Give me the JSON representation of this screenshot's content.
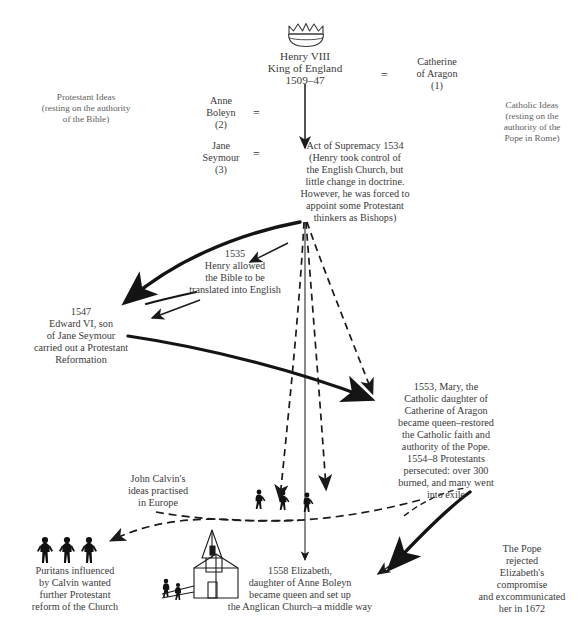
{
  "diagram": {
    "monarch": {
      "icon": "crown-icon",
      "name": "Henry VIII",
      "style": "King of England",
      "reign": "1509–47"
    },
    "wives": [
      {
        "name": "Catherine\nof Aragon",
        "order": "(1)",
        "marriage_symbol": "="
      },
      {
        "name": "Anne\nBoleyn",
        "order": "(2)",
        "marriage_symbol": "="
      },
      {
        "name": "Jane\nSeymour",
        "order": "(3)",
        "marriage_symbol": "="
      }
    ],
    "side_labels": {
      "left": "Protestant Ideas\n(resting on the authority\nof the Bible)",
      "right": "Catholic Ideas\n(resting on the\nauthority of the\nPope in Rome)"
    },
    "events": {
      "act_of_supremacy": "Act of Supremacy 1534\n(Henry took control of\nthe English Church, but\nlittle change in doctrine.\nHowever, he was forced to\nappoint some Protestant\nthinkers as Bishops)",
      "bible_english": "1535\nHenry allowed\nthe Bible to be\ntranslated into English",
      "edward_vi": "1547\nEdward VI, son\nof Jane Seymour\ncarried out a Protestant\nReformation",
      "mary_i": "1553, Mary, the\nCatholic daughter of\nCatherine of Aragon\nbecame queen–restored\nthe Catholic faith and\nauthority of the Pope.\n1554–8 Protestants\npersecuted: over 300\nburned, and many went\ninto exile",
      "calvin": "John Calvin's\nideas practised\nin Europe",
      "puritans": "Puritans influenced\nby Calvin wanted\nfurther Protestant\nreform of the Church",
      "elizabeth": "1558 Elizabeth,\ndaughter of Anne Boleyn\nbecame queen and set up\nthe Anglican Church–a middle way",
      "pope": "The Pope\nrejected\nElizabeth's\ncompromise\nand excommunicated\nher in 1672"
    },
    "icons": {
      "crown": "crown-icon",
      "puritan_figures": "three-people-icon",
      "exile_figures": "walking-people-icon",
      "church": "church-building-icon"
    },
    "colors": {
      "ink": "#3a3a3a",
      "stroke": "#1a1a1a",
      "background": "#ffffff"
    }
  }
}
